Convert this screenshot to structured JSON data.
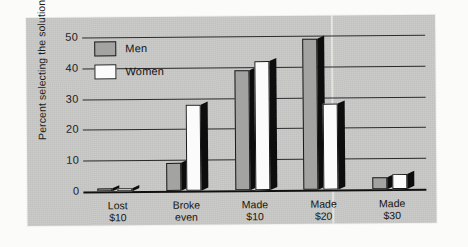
{
  "chart_data": {
    "type": "bar",
    "title": "",
    "xlabel": "",
    "ylabel": "Percent selecting the solution",
    "categories": [
      "Lost $10",
      "Broke even",
      "Made $10",
      "Made $20",
      "Made $30"
    ],
    "category_lines": [
      [
        "Lost",
        "$10"
      ],
      [
        "Broke",
        "even"
      ],
      [
        "Made",
        "$10"
      ],
      [
        "Made",
        "$20"
      ],
      [
        "Made",
        "$30"
      ]
    ],
    "series": [
      {
        "name": "Men",
        "color": "#a3a3a1",
        "values": [
          1,
          9,
          39,
          49,
          4
        ]
      },
      {
        "name": "Women",
        "color": "#ffffff",
        "values": [
          1,
          28,
          42,
          28,
          5
        ]
      }
    ],
    "ylim": [
      0,
      50
    ],
    "yticks": [
      0,
      10,
      20,
      30,
      40,
      50
    ],
    "ytick_labels": [
      "0",
      "10",
      "20",
      "30",
      "40",
      "50"
    ],
    "grid": true,
    "legend_position": "top-left",
    "legend": [
      "Men",
      "Women"
    ]
  },
  "legend": {
    "men_label": "Men",
    "women_label": "Women"
  },
  "colors": {
    "panel_background": "#c9c9c7",
    "men_bar": "#a3a3a1",
    "women_bar": "#fbfbfb",
    "bar_shadow": "#0d0d0d",
    "axis": "#1b1b1b"
  }
}
